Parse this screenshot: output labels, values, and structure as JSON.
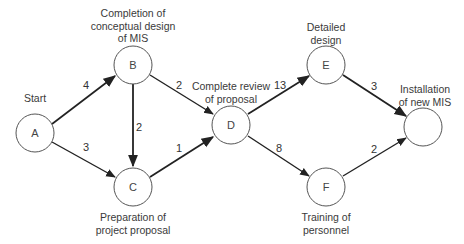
{
  "diagram": {
    "type": "network",
    "nodes": [
      {
        "id": "A",
        "letter": "A",
        "label": "Start",
        "x": 35,
        "y": 133
      },
      {
        "id": "B",
        "letter": "B",
        "label_lines": [
          "Completion of",
          "conceptual design",
          "of MIS"
        ],
        "x": 133,
        "y": 65
      },
      {
        "id": "C",
        "letter": "C",
        "label_lines": [
          "Preparation of",
          "project proposal"
        ],
        "x": 133,
        "y": 187
      },
      {
        "id": "D",
        "letter": "D",
        "label_lines": [
          "Complete review",
          "of proposal"
        ],
        "x": 231,
        "y": 125
      },
      {
        "id": "E",
        "letter": "E",
        "label_lines": [
          "Detailed",
          "design"
        ],
        "x": 326,
        "y": 65
      },
      {
        "id": "F",
        "letter": "F",
        "label_lines": [
          "Training of",
          "personnel"
        ],
        "x": 326,
        "y": 187
      },
      {
        "id": "G",
        "letter": "",
        "label_lines": [
          "Installation",
          "of new MIS"
        ],
        "x": 423,
        "y": 127
      }
    ],
    "edges": [
      {
        "from": "A",
        "to": "B",
        "weight": "4"
      },
      {
        "from": "A",
        "to": "C",
        "weight": "3"
      },
      {
        "from": "B",
        "to": "C",
        "weight": "2"
      },
      {
        "from": "B",
        "to": "D",
        "weight": "2"
      },
      {
        "from": "C",
        "to": "D",
        "weight": "1"
      },
      {
        "from": "D",
        "to": "E",
        "weight": "13"
      },
      {
        "from": "D",
        "to": "F",
        "weight": "8"
      },
      {
        "from": "E",
        "to": "G",
        "weight": "3"
      },
      {
        "from": "F",
        "to": "G",
        "weight": "2"
      }
    ]
  },
  "labels": {
    "A": "Start",
    "B": {
      "l1": "Completion of",
      "l2": "conceptual design",
      "l3": "of MIS"
    },
    "C": {
      "l1": "Preparation of",
      "l2": "project proposal"
    },
    "D": {
      "l1": "Complete review",
      "l2": "of proposal"
    },
    "E": {
      "l1": "Detailed",
      "l2": "design"
    },
    "F": {
      "l1": "Training of",
      "l2": "personnel"
    },
    "G": {
      "l1": "Installation",
      "l2": "of new MIS"
    }
  },
  "letters": {
    "A": "A",
    "B": "B",
    "C": "C",
    "D": "D",
    "E": "E",
    "F": "F"
  },
  "weights": {
    "AB": "4",
    "AC": "3",
    "BC": "2",
    "BD": "2",
    "CD": "1",
    "DE": "13",
    "DF": "8",
    "EG": "3",
    "FG": "2"
  }
}
